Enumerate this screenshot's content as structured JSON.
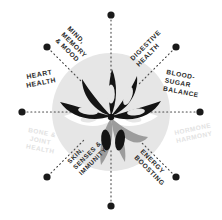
{
  "diagram": {
    "type": "radial-benefit-wheel",
    "title": "",
    "center": {
      "x": 111,
      "y": 112
    },
    "circle": {
      "cx": 111,
      "cy": 112,
      "r": 59,
      "fill": "#e6e6e6"
    },
    "colors": {
      "background": "#ffffff",
      "circle_fill": "#e6e6e6",
      "dot": "#1a1a1a",
      "spoke": "#3a3a3a",
      "label_dark": "#2b2b2b",
      "label_faded": "#e2e2e2",
      "petal_dark": "#141414",
      "petal_gray": "#9c9c9c",
      "petal_white": "#ffffff",
      "petal_mid": "#c9c9c9"
    },
    "spoke_count": 8,
    "spokes": [
      {
        "id": "mind-memory-mood",
        "label": "MIND, MEMORY & MOOD",
        "lines": [
          "MIND,",
          "MEMORY",
          "& MOOD"
        ],
        "angle_deg": -135,
        "dot": {
          "x": 47,
          "y": 47
        },
        "label_anchor": {
          "x": 72,
          "y": 38
        },
        "text_rotation_deg": 45,
        "emphasis": "dark"
      },
      {
        "id": "digestive-health",
        "label": "DIGESTIVE HEALTH",
        "lines": [
          "DIGESTIVE",
          "HEALTH"
        ],
        "angle_deg": -45,
        "dot": {
          "x": 176,
          "y": 47
        },
        "label_anchor": {
          "x": 148,
          "y": 38
        },
        "text_rotation_deg": -45,
        "emphasis": "dark"
      },
      {
        "id": "heart-health",
        "label": "HEART HEALTH",
        "lines": [
          "HEART",
          "HEALTH"
        ],
        "angle_deg": 180,
        "dot": {
          "x": 22,
          "y": 112
        },
        "label_anchor": {
          "x": 46,
          "y": 85
        },
        "text_rotation_deg": -12,
        "emphasis": "dark"
      },
      {
        "id": "blood-sugar-balance",
        "label": "BLOOD-SUGAR BALANCE",
        "lines": [
          "BLOOD-",
          "SUGAR",
          "BALANCE"
        ],
        "angle_deg": 0,
        "dot": {
          "x": 200,
          "y": 112
        },
        "label_anchor": {
          "x": 178,
          "y": 82
        },
        "text_rotation_deg": 12,
        "emphasis": "dark"
      },
      {
        "id": "bone-joint-health",
        "label": "BONE & JOINT HEALTH",
        "lines": [
          "BONE &",
          "JOINT",
          "HEALTH"
        ],
        "angle_deg": 180,
        "dot": {
          "x": 22,
          "y": 112
        },
        "label_anchor": {
          "x": 45,
          "y": 134
        },
        "text_rotation_deg": 12,
        "emphasis": "faded"
      },
      {
        "id": "hormone-harmony",
        "label": "HORMONE HARMONY",
        "lines": [
          "HORMONE",
          "HARMONY"
        ],
        "angle_deg": 0,
        "dot": {
          "x": 200,
          "y": 112
        },
        "label_anchor": {
          "x": 178,
          "y": 136
        },
        "text_rotation_deg": -12,
        "emphasis": "faded"
      },
      {
        "id": "skin-senses-immunity",
        "label": "SKIN, SENSES & IMMUNITY",
        "lines": [
          "SKIN,",
          "SENSES &",
          "IMMUNITY"
        ],
        "angle_deg": 135,
        "dot": {
          "x": 47,
          "y": 177
        },
        "label_anchor": {
          "x": 73,
          "y": 184
        },
        "text_rotation_deg": -45,
        "emphasis": "dark"
      },
      {
        "id": "energy-boosting",
        "label": "ENERGY BOOSTING",
        "lines": [
          "ENERGY",
          "BOOSTING"
        ],
        "angle_deg": 45,
        "dot": {
          "x": 176,
          "y": 177
        },
        "label_anchor": {
          "x": 148,
          "y": 184
        },
        "text_rotation_deg": 45,
        "emphasis": "dark"
      }
    ],
    "axis_dots": [
      {
        "id": "dot-top",
        "x": 111,
        "y": 15
      },
      {
        "id": "dot-bottom",
        "x": 111,
        "y": 206
      },
      {
        "id": "dot-left",
        "x": 22,
        "y": 112
      },
      {
        "id": "dot-right",
        "x": 200,
        "y": 112
      },
      {
        "id": "dot-top-left",
        "x": 47,
        "y": 47
      },
      {
        "id": "dot-top-right",
        "x": 176,
        "y": 47
      },
      {
        "id": "dot-bottom-left",
        "x": 47,
        "y": 177
      },
      {
        "id": "dot-bottom-right",
        "x": 176,
        "y": 177
      }
    ],
    "petals": [
      {
        "id": "petal-upper-left-outer",
        "tone": "dark"
      },
      {
        "id": "petal-upper-left-inner",
        "tone": "dark"
      },
      {
        "id": "petal-upper-center",
        "tone": "dark"
      },
      {
        "id": "petal-upper-right-inner",
        "tone": "dark"
      },
      {
        "id": "petal-upper-right-outer",
        "tone": "dark"
      },
      {
        "id": "petal-left-horizontal",
        "tone": "white"
      },
      {
        "id": "petal-right-horizontal",
        "tone": "white"
      },
      {
        "id": "petal-lower-left",
        "tone": "gray"
      },
      {
        "id": "petal-lower-center",
        "tone": "gray"
      },
      {
        "id": "petal-lower-right",
        "tone": "gray"
      }
    ]
  }
}
